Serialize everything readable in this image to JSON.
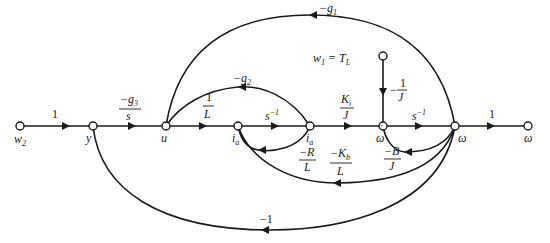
{
  "diagram": {
    "type": "signal-flow-graph",
    "nodes": [
      {
        "id": "w2",
        "label": "w2"
      },
      {
        "id": "y",
        "label": "y"
      },
      {
        "id": "u",
        "label": "u"
      },
      {
        "id": "ia1",
        "label": "i̇a"
      },
      {
        "id": "ia2",
        "label": "ia"
      },
      {
        "id": "wdot",
        "label": "ω̇"
      },
      {
        "id": "w",
        "label": "ω"
      },
      {
        "id": "wout",
        "label": "ω"
      },
      {
        "id": "w1",
        "label": "w1 = TL"
      }
    ],
    "edges": [
      {
        "from": "w2",
        "to": "y",
        "gain": "1"
      },
      {
        "from": "y",
        "to": "u",
        "gain": "-g3/s",
        "num": "−g3",
        "den": "s"
      },
      {
        "from": "u",
        "to": "ia1",
        "gain": "1/L",
        "num": "1",
        "den": "L"
      },
      {
        "from": "ia1",
        "to": "ia2",
        "gain": "s^-1"
      },
      {
        "from": "ia2",
        "to": "wdot",
        "gain": "Ki/J",
        "num": "Ki",
        "den": "J"
      },
      {
        "from": "wdot",
        "to": "w",
        "gain": "s^-1"
      },
      {
        "from": "w",
        "to": "wout",
        "gain": "1"
      },
      {
        "from": "w1",
        "to": "wdot",
        "gain": "-1/J"
      },
      {
        "from": "ia2",
        "to": "u",
        "gain": "-g2"
      },
      {
        "from": "w",
        "to": "u",
        "gain": "-g1"
      },
      {
        "from": "ia2",
        "to": "ia1",
        "gain": "-R/L",
        "num": "−R",
        "den": "L"
      },
      {
        "from": "w",
        "to": "ia1",
        "gain": "-Kb/L",
        "num": "−Kb",
        "den": "L"
      },
      {
        "from": "w",
        "to": "wdot",
        "gain": "-B/J",
        "num": "−B",
        "den": "J"
      },
      {
        "from": "w",
        "to": "y",
        "gain": "-1"
      }
    ]
  },
  "labels": {
    "w2": "w",
    "w2_sub": "2",
    "y": "y",
    "u": "u",
    "ia": "i",
    "ia_sub": "a",
    "omega": "ω",
    "w1": "w",
    "w1_sub": "1",
    "w1_eq": " = T",
    "w1_eq_sub": "L",
    "g1": "−g",
    "g1_sub": "1",
    "g2": "−g",
    "g2_sub": "2",
    "g3_num": "−g",
    "g3_sub": "3",
    "g3_den": "s",
    "oneL_num": "1",
    "oneL_den": "L",
    "sinv1": "s",
    "sinv1_sup": "−1",
    "sinv2": "s",
    "sinv2_sup": "−1",
    "Ki_num": "K",
    "Ki_sub": "i",
    "Ki_den": "J",
    "oneJ_sign": "−",
    "oneJ_num": "1",
    "oneJ_den": "J",
    "R_num": "−R",
    "R_den": "L",
    "Kb_num": "−K",
    "Kb_sub": "b",
    "Kb_den": "L",
    "B_num": "−B",
    "B_den": "J",
    "one_in": "1",
    "one_out": "1",
    "minus_one": "−1"
  }
}
